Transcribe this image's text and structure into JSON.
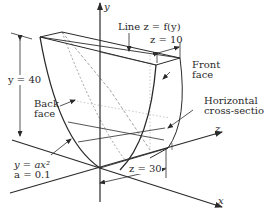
{
  "diagram": {
    "axes": {
      "x_label": "x",
      "y_label": "y",
      "z_label": "z"
    },
    "labels": {
      "line": "Line z = f(y)",
      "z10": "z = 10",
      "front_face_1": "Front",
      "front_face_2": "face",
      "horizontal_1": "Horizontal",
      "horizontal_2": "cross-section",
      "back_face_1": "Back",
      "back_face_2": "face",
      "height": "y = 40",
      "equation": "y = ax²",
      "a_value": "a = 0.1",
      "z30": "z = 30"
    },
    "colors": {
      "stroke": "#2a2a2a",
      "dashed": "#8a8a8a",
      "dotted": "#b0b0b0",
      "background": "#ffffff"
    }
  }
}
